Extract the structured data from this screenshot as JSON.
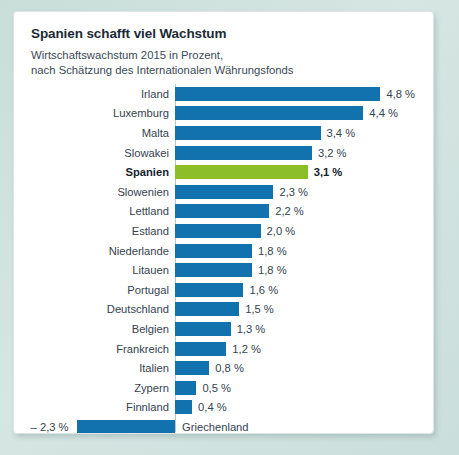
{
  "card": {
    "title": "Spanien schafft viel Wachstum",
    "subtitle_line1": "Wirtschaftswachstum 2015 in Prozent,",
    "subtitle_line2": "nach Schätzung des Internationalen Währungsfonds"
  },
  "colors": {
    "bar_blue": "#1172ad",
    "bar_green": "#8cbe2a",
    "page_background": "#cfe0dd",
    "card_background": "#ffffff",
    "text": "#34444f"
  },
  "chart_data": {
    "type": "bar",
    "orientation": "horizontal",
    "title": "Spanien schafft viel Wachstum",
    "subtitle": "Wirtschaftswachstum 2015 in Prozent, nach Schätzung des Internationalen Währungsfonds",
    "xlabel": "",
    "ylabel": "",
    "xlim": [
      -2.3,
      4.8
    ],
    "grid": false,
    "legend": false,
    "unit": "%",
    "decimal_separator": ",",
    "highlight_category": "Spanien",
    "categories": [
      "Irland",
      "Luxemburg",
      "Malta",
      "Slowakei",
      "Spanien",
      "Slowenien",
      "Lettland",
      "Estland",
      "Niederlande",
      "Litauen",
      "Portugal",
      "Deutschland",
      "Belgien",
      "Frankreich",
      "Italien",
      "Zypern",
      "Finnland",
      "Griechenland"
    ],
    "values": [
      4.8,
      4.4,
      3.4,
      3.2,
      3.1,
      2.3,
      2.2,
      2.0,
      1.8,
      1.8,
      1.6,
      1.5,
      1.3,
      1.2,
      0.8,
      0.5,
      0.4,
      -2.3
    ],
    "value_labels": [
      "4,8 %",
      "4,4 %",
      "3,4 %",
      "3,2 %",
      "3,1 %",
      "2,3 %",
      "2,2 %",
      "2,0 %",
      "1,8 %",
      "1,8 %",
      "1,6 %",
      "1,5 %",
      "1,3 %",
      "1,2 %",
      "0,8 %",
      "0,5 %",
      "0,4 %",
      "– 2,3 %"
    ],
    "bars": [
      {
        "label": "Irland",
        "value": 4.8,
        "value_label": "4,8 %",
        "highlight": false
      },
      {
        "label": "Luxemburg",
        "value": 4.4,
        "value_label": "4,4 %",
        "highlight": false
      },
      {
        "label": "Malta",
        "value": 3.4,
        "value_label": "3,4 %",
        "highlight": false
      },
      {
        "label": "Slowakei",
        "value": 3.2,
        "value_label": "3,2 %",
        "highlight": false
      },
      {
        "label": "Spanien",
        "value": 3.1,
        "value_label": "3,1 %",
        "highlight": true
      },
      {
        "label": "Slowenien",
        "value": 2.3,
        "value_label": "2,3 %",
        "highlight": false
      },
      {
        "label": "Lettland",
        "value": 2.2,
        "value_label": "2,2 %",
        "highlight": false
      },
      {
        "label": "Estland",
        "value": 2.0,
        "value_label": "2,0 %",
        "highlight": false
      },
      {
        "label": "Niederlande",
        "value": 1.8,
        "value_label": "1,8 %",
        "highlight": false
      },
      {
        "label": "Litauen",
        "value": 1.8,
        "value_label": "1,8 %",
        "highlight": false
      },
      {
        "label": "Portugal",
        "value": 1.6,
        "value_label": "1,6 %",
        "highlight": false
      },
      {
        "label": "Deutschland",
        "value": 1.5,
        "value_label": "1,5 %",
        "highlight": false
      },
      {
        "label": "Belgien",
        "value": 1.3,
        "value_label": "1,3 %",
        "highlight": false
      },
      {
        "label": "Frankreich",
        "value": 1.2,
        "value_label": "1,2 %",
        "highlight": false
      },
      {
        "label": "Italien",
        "value": 0.8,
        "value_label": "0,8 %",
        "highlight": false
      },
      {
        "label": "Zypern",
        "value": 0.5,
        "value_label": "0,5 %",
        "highlight": false
      },
      {
        "label": "Finnland",
        "value": 0.4,
        "value_label": "0,4 %",
        "highlight": false
      },
      {
        "label": "Griechenland",
        "value": -2.3,
        "value_label": "– 2,3 %",
        "highlight": false
      }
    ]
  }
}
